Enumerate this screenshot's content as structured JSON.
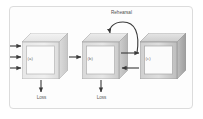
{
  "figure": {
    "frame": {
      "border_color": "#dcdcdc",
      "background_color": "#fdfdfd"
    },
    "boxes": [
      {
        "id": "a",
        "label": "(a)",
        "fill_top": "#ededed",
        "fill_side": "#d9d9d9",
        "fill_face": "#e9e9e9"
      },
      {
        "id": "b",
        "label": "(b)",
        "fill_top": "#e2e2e2",
        "fill_side": "#c9c9c9",
        "fill_face": "#dedede"
      },
      {
        "id": "c",
        "label": "(c)",
        "fill_top": "#d6d6d6",
        "fill_side": "#b6b6b6",
        "fill_face": "#d2d2d2"
      }
    ],
    "annotations": {
      "rehearsal": "Rehearsal",
      "loss_a": "Loss",
      "loss_b": "Loss"
    },
    "arrows": {
      "input_count": 3,
      "a_to_b": "forward",
      "b_to_c": "forward",
      "c_to_b": "backward",
      "rehearsal_loop": "curved self-loop from c back into b"
    },
    "colors": {
      "stroke": "#3a3a3a",
      "text": "#5c5c5c",
      "frame": "#dcdcdc"
    }
  }
}
